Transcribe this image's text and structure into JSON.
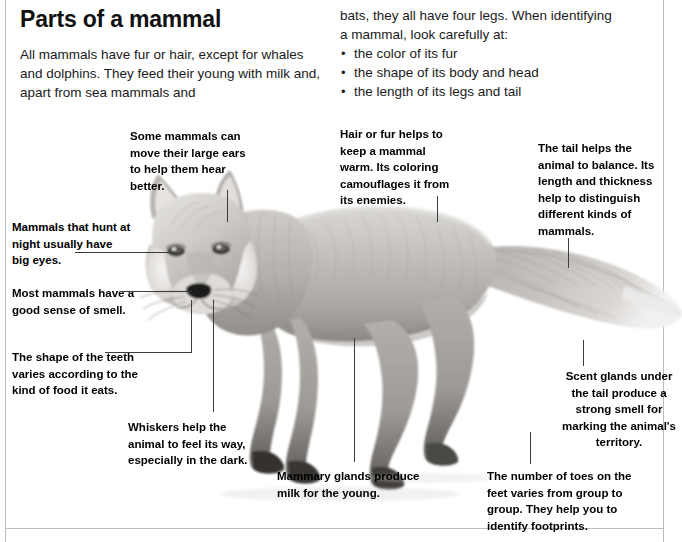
{
  "page": {
    "title": "Parts of a mammal",
    "intro_left": "All mammals have fur or hair, except for whales and dolphins. They feed their young with milk and, apart from sea mammals and",
    "intro_right_line1": "bats, they all have four legs. When identifying",
    "intro_right_line2": "a mammal, look carefully at:",
    "bullets": [
      "the color of its fur",
      "the shape of its body and head",
      "the length of its legs and tail"
    ]
  },
  "callouts": {
    "ears": "Some mammals can move their large ears to help them hear better.",
    "fur": "Hair or fur helps to keep a mammal warm. Its coloring camouflages it from its enemies.",
    "tail": "The tail helps the animal to balance. Its length and thickness help to distinguish different kinds of mammals.",
    "eyes": "Mammals that hunt at night usually have big eyes.",
    "smell": "Most mammals have a good sense of smell.",
    "teeth": "The shape of the teeth varies according to the kind of food it eats.",
    "whiskers": "Whiskers help the animal to feel its way, especially in the dark.",
    "mammary": "Mammary glands produce milk for the young.",
    "scent": "Scent glands under the tail produce a strong smell for marking the animal's territory.",
    "toes": "The number of toes on the feet varies from group to group. They help you to identify footprints."
  },
  "illustration": {
    "subject": "fox-photograph",
    "description": "Grayscale photograph of a red fox standing in profile facing the viewer with a long bushy tail"
  },
  "colors": {
    "text": "#000000",
    "leader_line": "#3d3d3d",
    "page_border": "#b9bcc0",
    "background": "#ffffff"
  }
}
